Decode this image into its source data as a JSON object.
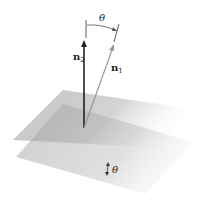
{
  "diagram": {
    "labels": {
      "theta_top": "θ",
      "n2": "n",
      "n2_sub": "2",
      "n1": "n",
      "n1_sub": "1",
      "theta_planes": "θ"
    },
    "vectors": [
      {
        "name": "n2",
        "color": "#222222",
        "from": [
          84,
          128
        ],
        "to": [
          84,
          40
        ]
      },
      {
        "name": "n1",
        "color": "#999999",
        "from": [
          84,
          128
        ],
        "to": [
          114,
          44
        ]
      }
    ],
    "planes": [
      {
        "name": "plane-1",
        "color": "#9a9a9a"
      },
      {
        "name": "plane-2",
        "color": "#a8a8a8"
      }
    ]
  }
}
